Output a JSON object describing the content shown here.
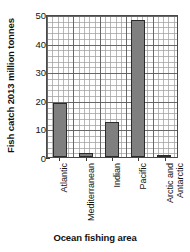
{
  "chart_data": {
    "type": "bar",
    "title": "",
    "categories": [
      "Atlantic",
      "Mediterranean",
      "Indian",
      "Pacific",
      "Arctic and Antarctic"
    ],
    "values": [
      19,
      1.3,
      12.3,
      48.5,
      0.3
    ],
    "xlabel": "Ocean fishing area",
    "ylabel": "Fish catch 2013 million tonnes",
    "ylim": [
      0,
      50
    ],
    "yticks": [
      0,
      10,
      20,
      30,
      40,
      50
    ],
    "ytick_labels": [
      "0",
      "10",
      "20",
      "30",
      "40",
      "50"
    ],
    "grid": "major and minor gridlines on both axes",
    "legend": "none",
    "bar_color": "#7f7f7f",
    "bar_edge_color": "#2b2b2b",
    "axis_color": "#4a4a4a",
    "gridline_major_color": "#5a5a5a",
    "gridline_minor_color": "#a0a0a0",
    "background": "#ffffff"
  },
  "axes": {
    "y_title": "Fish catch 2013 million tonnes",
    "x_title": "Ocean fishing area",
    "y_tick_labels": [
      "50",
      "40",
      "30",
      "20",
      "10",
      "0"
    ],
    "x_tick_labels": [
      {
        "line1": "Atlantic",
        "line2": ""
      },
      {
        "line1": "Mediterranean",
        "line2": ""
      },
      {
        "line1": "Indian",
        "line2": ""
      },
      {
        "line1": "Pacific",
        "line2": ""
      },
      {
        "line1": "Arctic and",
        "line2": "Antarctic"
      }
    ]
  },
  "top_crop_text": ""
}
